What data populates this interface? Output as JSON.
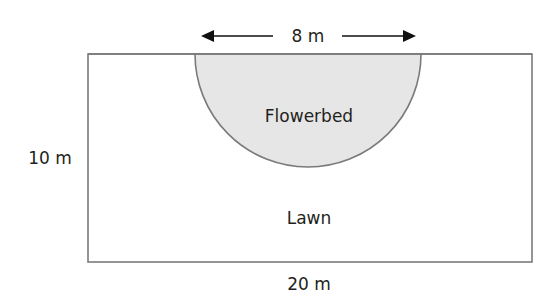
{
  "diagram": {
    "top_dimension": "8 m",
    "left_dimension": "10 m",
    "bottom_dimension": "20 m",
    "flowerbed_label": "Flowerbed",
    "lawn_label": "Lawn",
    "colors": {
      "outline": "#7a7a7a",
      "flowerbed_fill": "#e6e6e6",
      "text": "#231f20",
      "arrow": "#111111"
    }
  }
}
